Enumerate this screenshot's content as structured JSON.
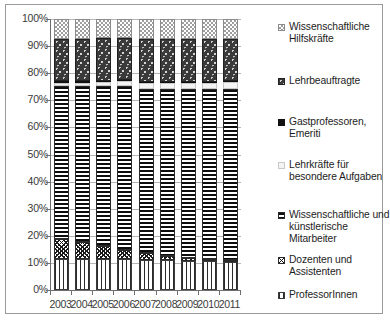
{
  "chart_data": {
    "type": "bar",
    "subtype": "100% stacked column",
    "title": "",
    "xlabel": "",
    "ylabel": "",
    "ylim": [
      0,
      100
    ],
    "ytick_labels": [
      "0%",
      "10%",
      "20%",
      "30%",
      "40%",
      "50%",
      "60%",
      "70%",
      "80%",
      "90%",
      "100%"
    ],
    "ytick_values": [
      0,
      10,
      20,
      30,
      40,
      50,
      60,
      70,
      80,
      90,
      100
    ],
    "grid": true,
    "legend_position": "right",
    "categories": [
      "2003",
      "2004",
      "2005",
      "2006",
      "2007",
      "2008",
      "2009",
      "2010",
      "2011"
    ],
    "stack_order_bottom_to_top": [
      "ProfessorInnen",
      "Dozenten und Assistenten",
      "Wissenschaftliche und künstlerische Mitarbeiter",
      "Lehrkräfte für besondere Aufgaben",
      "Gastprofessoren, Emeriti",
      "Lehrbeauftragte",
      "Wissenschaftliche Hilfskräfte"
    ],
    "series": [
      {
        "name": "ProfessorInnen",
        "pattern": "vertical-stripes",
        "values": [
          11.5,
          11.5,
          11.3,
          11.3,
          11.0,
          11.0,
          10.8,
          10.6,
          10.4
        ]
      },
      {
        "name": "Dozenten und Assistenten",
        "pattern": "diagonal-crosshatch",
        "values": [
          7.3,
          6.3,
          5.0,
          3.6,
          2.5,
          1.5,
          1.0,
          0.8,
          0.6
        ]
      },
      {
        "name": "Wissenschaftliche und künstlerische Mitarbeiter",
        "pattern": "horizontal-stripes",
        "values": [
          56.4,
          57.4,
          58.9,
          60.3,
          60.8,
          61.7,
          62.4,
          62.8,
          63.2
        ]
      },
      {
        "name": "Lehrkräfte für besondere Aufgaben",
        "pattern": "light-solid",
        "values": [
          1.1,
          1.3,
          1.6,
          1.8,
          2.0,
          2.1,
          2.2,
          2.3,
          2.4
        ]
      },
      {
        "name": "Gastprofessoren, Emeriti",
        "pattern": "solid-black",
        "values": [
          0.7,
          0.6,
          0.5,
          0.5,
          0.5,
          0.5,
          0.4,
          0.4,
          0.4
        ]
      },
      {
        "name": "Lehrbeauftragte",
        "pattern": "dark-speckled",
        "values": [
          15.6,
          15.4,
          15.7,
          15.5,
          15.8,
          15.7,
          15.7,
          15.6,
          15.5
        ]
      },
      {
        "name": "Wissenschaftliche Hilfskräfte",
        "pattern": "light-checkerboard",
        "values": [
          7.4,
          7.5,
          7.0,
          7.0,
          7.4,
          7.5,
          7.5,
          7.5,
          7.5
        ]
      }
    ]
  },
  "legend": {
    "items": [
      {
        "label": "Wissenschaftliche Hilfskräfte",
        "key": "legend-key-hilfskraefte"
      },
      {
        "label": "Lehrbeauftragte",
        "key": "legend-key-lehrbeauftragte"
      },
      {
        "label": "Gastprofessoren, Emeriti",
        "key": "legend-key-gastprofessoren"
      },
      {
        "label": "Lehrkräfte für besondere Aufgaben",
        "key": "legend-key-lehrkraefte"
      },
      {
        "label": "Wissenschaftliche und künstlerische Mitarbeiter",
        "key": "legend-key-mitarbeiter"
      },
      {
        "label": "Dozenten und Assistenten",
        "key": "legend-key-dozenten"
      },
      {
        "label": "ProfessorInnen",
        "key": "legend-key-professorinnen"
      }
    ]
  },
  "colors": {
    "axis": "#6e6e6e",
    "gridline": "#b6b6b6",
    "text": "#3a3a3a",
    "frame": "#9a9a9a"
  }
}
